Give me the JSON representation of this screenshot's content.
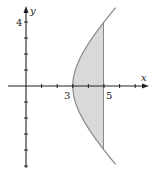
{
  "diagram": {
    "type": "region-under-hyperbola",
    "curve": "x^2 - y^2 = 9",
    "shaded_region": {
      "x_from": 3,
      "x_to": 5
    },
    "axes": {
      "x_label": "x",
      "y_label": "y",
      "x_ticks": [
        1,
        2,
        3,
        4,
        5,
        6,
        7
      ],
      "y_ticks": [
        -5,
        -4,
        -3,
        -2,
        -1,
        1,
        2,
        3,
        4
      ],
      "labeled": {
        "x": [
          "3",
          "5"
        ],
        "y": [
          "4"
        ]
      }
    },
    "labels": {
      "x_axis": "x",
      "y_axis": "y",
      "x_three": "3",
      "x_five": "5",
      "y_four": "4"
    },
    "colors": {
      "axis": "#222222",
      "curve": "#888888",
      "fill": "#d9d9d9"
    }
  }
}
